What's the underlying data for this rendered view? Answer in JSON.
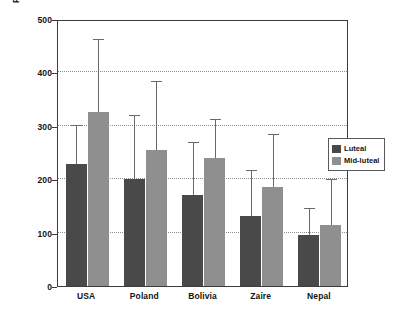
{
  "chart_data": {
    "type": "bar",
    "title": "",
    "subtitle": "",
    "xlabel": "",
    "ylabel": "Progesterone (pmol/l)",
    "categories": [
      "USA",
      "Poland",
      "Bolivia",
      "Zaire",
      "Nepal"
    ],
    "ylim": [
      0,
      500
    ],
    "yticks": [
      0,
      100,
      200,
      300,
      400,
      500
    ],
    "ytick_labels": [
      "0",
      "100",
      "200",
      "300",
      "400",
      "500"
    ],
    "grid": true,
    "gridlines_at": [
      100,
      200,
      300,
      400
    ],
    "legend_position": "right-middle",
    "series": [
      {
        "name": "Luteal",
        "color": "#494949",
        "values": [
          228,
          200,
          170,
          132,
          95
        ],
        "error_high": [
          300,
          318,
          268,
          215,
          145
        ]
      },
      {
        "name": "Mid-luteal",
        "color": "#8f8f8f",
        "values": [
          325,
          255,
          240,
          185,
          115
        ],
        "error_high": [
          460,
          382,
          310,
          282,
          198
        ]
      }
    ]
  },
  "legend": {
    "entries": [
      {
        "label": "Luteal"
      },
      {
        "label": "Mid-luteal"
      }
    ]
  },
  "colors": {
    "luteal": "#494949",
    "mid_luteal": "#8f8f8f",
    "axis": "#3c3c3c",
    "grid": "#8e8e8e",
    "error": "#6a6a6a",
    "background": "#ffffff"
  }
}
